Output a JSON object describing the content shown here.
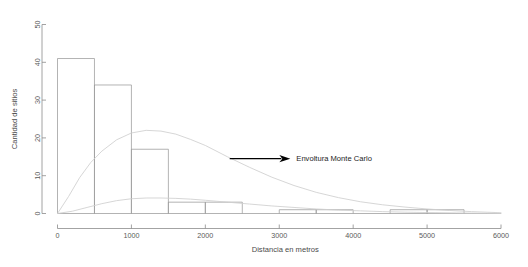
{
  "chart_data": {
    "type": "bar",
    "title": "",
    "subtitle": "",
    "xlabel": "Distancia en metros",
    "ylabel": "Cantidad de sitios",
    "xlim": [
      0,
      6000
    ],
    "ylim": [
      0,
      50
    ],
    "grid": false,
    "legend": "none",
    "bin_width": 500,
    "bin_edges": [
      0,
      500,
      1000,
      1500,
      2000,
      2500,
      3000,
      3500,
      4000,
      4500,
      5000,
      5500,
      6000
    ],
    "categories": [
      "0-500",
      "500-1000",
      "1000-1500",
      "1500-2000",
      "2000-2500",
      "2500-3000",
      "3000-3500",
      "3500-4000",
      "4000-4500",
      "4500-5000",
      "5000-5500",
      "5500-6000"
    ],
    "values": [
      41,
      34,
      17,
      3,
      3,
      0,
      1,
      1,
      0,
      1,
      1,
      0
    ],
    "xticks": [
      0,
      1000,
      2000,
      3000,
      4000,
      5000,
      6000
    ],
    "xticklabels": [
      "0",
      "1000",
      "2000",
      "3000",
      "4000",
      "5000",
      "6000"
    ],
    "yticks": [
      0,
      10,
      20,
      30,
      40,
      50
    ],
    "yticklabels": [
      "0",
      "10",
      "20",
      "30",
      "40",
      "50"
    ],
    "series": [
      {
        "name": "Histograma observado",
        "type": "bar",
        "values": [
          41,
          34,
          17,
          3,
          3,
          0,
          1,
          1,
          0,
          1,
          1,
          0
        ]
      },
      {
        "name": "Envoltura Monte Carlo superior",
        "type": "line",
        "x": [
          0,
          150,
          300,
          450,
          600,
          800,
          1000,
          1200,
          1400,
          1600,
          1800,
          2000,
          2300,
          2600,
          2900,
          3200,
          3500,
          3800,
          4100,
          4400,
          4700,
          5000,
          5300,
          5600,
          6000
        ],
        "y": [
          0,
          4.5,
          9.5,
          13.5,
          16.5,
          19.5,
          21.3,
          22.0,
          21.8,
          21.0,
          19.6,
          18.0,
          15.0,
          12.2,
          9.6,
          7.4,
          5.6,
          4.2,
          3.1,
          2.3,
          1.7,
          1.2,
          0.8,
          0.5,
          0.2
        ]
      },
      {
        "name": "Envoltura Monte Carlo inferior",
        "type": "line",
        "x": [
          0,
          200,
          400,
          600,
          800,
          1000,
          1200,
          1400,
          1600,
          1800,
          2000,
          2300,
          2600,
          2900,
          3200,
          3500,
          3800,
          4100,
          4400,
          4700,
          5000,
          5400,
          5800,
          6000
        ],
        "y": [
          0,
          0.6,
          1.6,
          2.6,
          3.4,
          3.9,
          4.1,
          4.1,
          4.0,
          3.8,
          3.5,
          3.0,
          2.5,
          2.0,
          1.6,
          1.2,
          0.9,
          0.7,
          0.5,
          0.35,
          0.25,
          0.15,
          0.05,
          0.0
        ]
      }
    ],
    "annotations": [
      {
        "label": "Envoltura Monte Carlo",
        "arrow": true,
        "arrow_direction": "right",
        "arrow_from_x": 2330,
        "arrow_to_x": 3150,
        "arrow_y": 14.5
      }
    ]
  }
}
